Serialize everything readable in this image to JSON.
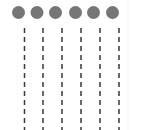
{
  "diagram": {
    "node_color": "#767676",
    "line_color": "#3a3a3a",
    "nodes": [
      {
        "id": "node-1",
        "cx": 18.5,
        "cy": 12.5
      },
      {
        "id": "node-2",
        "cx": 37,
        "cy": 12.5
      },
      {
        "id": "node-3",
        "cx": 55.5,
        "cy": 12.5
      },
      {
        "id": "node-4",
        "cx": 75.5,
        "cy": 12.5
      },
      {
        "id": "node-5",
        "cx": 93.5,
        "cy": 12.5
      },
      {
        "id": "node-6",
        "cx": 112.5,
        "cy": 12.5
      }
    ],
    "lifelines": [
      {
        "id": "lifeline-1",
        "x": 24.5,
        "y_start": 28,
        "y_end": 130
      },
      {
        "id": "lifeline-2",
        "x": 43,
        "y_start": 28,
        "y_end": 130
      },
      {
        "id": "lifeline-3",
        "x": 62,
        "y_start": 28,
        "y_end": 130
      },
      {
        "id": "lifeline-4",
        "x": 81,
        "y_start": 28,
        "y_end": 130
      },
      {
        "id": "lifeline-5",
        "x": 100,
        "y_start": 28,
        "y_end": 130
      },
      {
        "id": "lifeline-6",
        "x": 119,
        "y_start": 28,
        "y_end": 130
      }
    ],
    "dash_pattern": {
      "dash": 5,
      "gap": 4
    }
  }
}
